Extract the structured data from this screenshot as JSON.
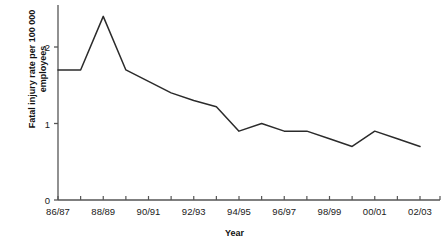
{
  "chart_data": {
    "type": "line",
    "title": "",
    "xlabel": "Year",
    "ylabel": "Fatal injury rate per 100 000\nemployees",
    "ylabel_line1": "Fatal injury rate per 100 000",
    "ylabel_line2": "employees",
    "categories": [
      "86/87",
      "87/88",
      "88/89",
      "89/90",
      "90/91",
      "91/92",
      "92/93",
      "93/94",
      "94/95",
      "95/96",
      "96/97",
      "97/98",
      "98/99",
      "99/00",
      "00/01",
      "01/02",
      "02/03"
    ],
    "values": [
      1.7,
      1.7,
      2.4,
      1.7,
      1.55,
      1.4,
      1.3,
      1.22,
      0.9,
      1.0,
      0.9,
      0.9,
      0.8,
      0.7,
      0.9,
      0.8,
      0.7
    ],
    "x_tick_labels": [
      "86/87",
      "88/89",
      "90/91",
      "92/93",
      "94/95",
      "96/97",
      "98/99",
      "00/01",
      "02/03"
    ],
    "x_tick_label_indices": [
      0,
      2,
      4,
      6,
      8,
      10,
      12,
      14,
      16
    ],
    "y_tick_labels": [
      "0",
      "1",
      "2"
    ],
    "y_tick_values": [
      0,
      1,
      2
    ],
    "ylim": [
      0,
      2.55
    ],
    "xlim": [
      0,
      16
    ],
    "grid": false,
    "legend": null,
    "legend_position": "none",
    "line_color": "#2b2b2b",
    "axis_color": "#555555"
  }
}
